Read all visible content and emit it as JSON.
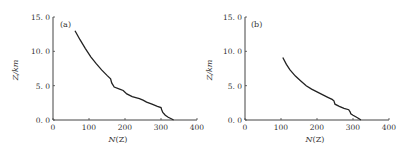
{
  "chart_data": [
    {
      "type": "line",
      "panel_label": "(a)",
      "title": "",
      "xlabel": "N(Z)",
      "ylabel": "Z/km",
      "xlim": [
        0,
        400
      ],
      "ylim": [
        0,
        15
      ],
      "xticks": [
        "0",
        "100",
        "200",
        "300",
        "400"
      ],
      "yticks": [
        "0. 0",
        "5. 0",
        "10. 0",
        "15. 0"
      ],
      "grid": false,
      "legend": null,
      "series": [
        {
          "name": "N(Z) profile (a)",
          "x": [
            61,
            75,
            90,
            105,
            120,
            135,
            150,
            160,
            163,
            170,
            185,
            195,
            205,
            220,
            240,
            250,
            260,
            275,
            290,
            300,
            302,
            305,
            312,
            320,
            330,
            335
          ],
          "y": [
            13.0,
            11.7,
            10.4,
            9.2,
            8.2,
            7.3,
            6.5,
            6.0,
            5.4,
            4.8,
            4.5,
            4.3,
            3.8,
            3.4,
            3.1,
            2.9,
            2.6,
            2.3,
            2.0,
            1.8,
            1.5,
            1.1,
            0.7,
            0.4,
            0.15,
            0.0
          ]
        }
      ]
    },
    {
      "type": "line",
      "panel_label": "(b)",
      "title": "",
      "xlabel": "N(Z)",
      "ylabel": "Z/km",
      "xlim": [
        0,
        400
      ],
      "ylim": [
        0,
        15
      ],
      "xticks": [
        "0",
        "100",
        "200",
        "300",
        "400"
      ],
      "yticks": [
        "0. 0",
        "5. 0",
        "10. 0",
        "15. 0"
      ],
      "grid": false,
      "legend": null,
      "series": [
        {
          "name": "N(Z) profile (b)",
          "x": [
            105,
            115,
            125,
            140,
            155,
            170,
            185,
            200,
            215,
            230,
            242,
            247,
            250,
            262,
            275,
            288,
            292,
            294,
            300,
            310,
            318,
            322
          ],
          "y": [
            9.1,
            8.1,
            7.3,
            6.4,
            5.7,
            5.0,
            4.5,
            4.1,
            3.7,
            3.3,
            3.0,
            2.8,
            2.3,
            2.0,
            1.7,
            1.5,
            1.2,
            0.9,
            0.7,
            0.4,
            0.15,
            0.0
          ]
        }
      ]
    }
  ],
  "panels": [
    {
      "label": "(a)",
      "xlabel_main": "N",
      "xlabel_paren": "(Z)",
      "ylabel": "Z/km"
    },
    {
      "label": "(b)",
      "xlabel_main": "N",
      "xlabel_paren": "(Z)",
      "ylabel": "Z/km"
    }
  ],
  "colors": {
    "line": "#222222",
    "axis": "#444444",
    "text": "#333333",
    "background": "#ffffff"
  }
}
